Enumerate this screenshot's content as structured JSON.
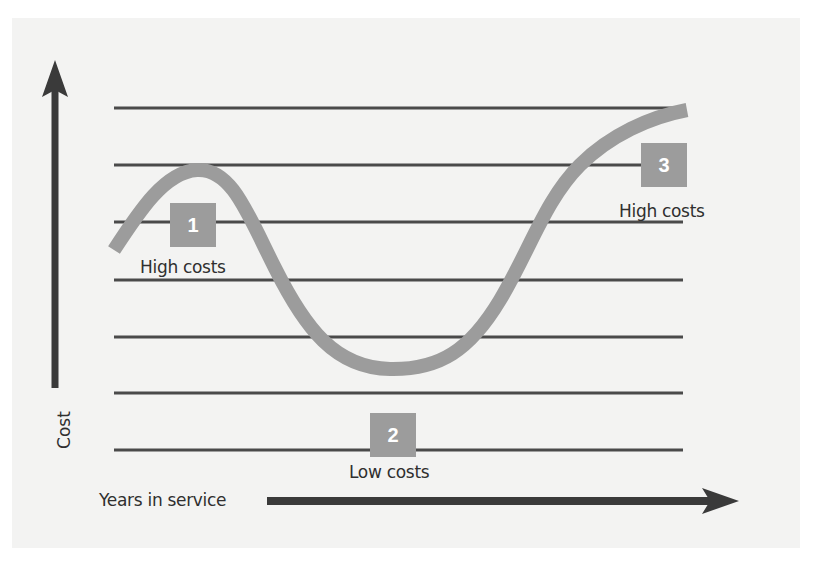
{
  "diagram": {
    "y_axis_label": "Cost",
    "x_axis_label": "Years in service",
    "colors": {
      "background": "#f3f3f2",
      "axis": "#3a3a3a",
      "gridline": "#4a4a4a",
      "curve": "#9c9c9c",
      "badge": "#9c9c9c",
      "badge_text": "#ffffff",
      "text": "#2f2f2f"
    },
    "gridline_count": 7,
    "phases": [
      {
        "number": "1",
        "label": "High costs"
      },
      {
        "number": "2",
        "label": "Low costs"
      },
      {
        "number": "3",
        "label": "High costs"
      }
    ]
  }
}
